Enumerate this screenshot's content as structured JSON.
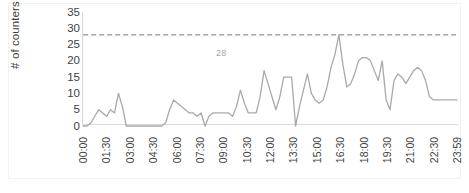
{
  "chart_data": {
    "type": "line",
    "title": "",
    "xlabel": "",
    "ylabel": "# of counters",
    "ylim": [
      0,
      35
    ],
    "yticks": [
      0,
      5,
      10,
      15,
      20,
      25,
      30,
      35
    ],
    "grid": false,
    "legend": "none",
    "line_color": "#a9a9a9",
    "threshold": {
      "value": 28,
      "label": "28",
      "style": "dashed",
      "color": "#a6a6a6"
    },
    "xtick_labels": [
      "00:00",
      "01:30",
      "03:00",
      "04:30",
      "06:00",
      "07:30",
      "09:00",
      "10:30",
      "12:00",
      "13:30",
      "15:00",
      "16:30",
      "18:00",
      "19:30",
      "21:00",
      "22:30",
      "23:59"
    ],
    "x": [
      "00:00",
      "00:15",
      "00:30",
      "00:45",
      "01:00",
      "01:15",
      "01:30",
      "01:45",
      "02:00",
      "02:15",
      "02:30",
      "02:45",
      "03:00",
      "03:15",
      "03:30",
      "03:45",
      "04:00",
      "04:15",
      "04:30",
      "04:45",
      "05:00",
      "05:15",
      "05:30",
      "05:45",
      "06:00",
      "06:15",
      "06:30",
      "06:45",
      "07:00",
      "07:15",
      "07:30",
      "07:45",
      "08:00",
      "08:15",
      "08:30",
      "08:45",
      "09:00",
      "09:15",
      "09:30",
      "09:45",
      "10:00",
      "10:15",
      "10:30",
      "10:45",
      "11:00",
      "11:15",
      "11:30",
      "11:45",
      "12:00",
      "12:15",
      "12:30",
      "12:45",
      "13:00",
      "13:15",
      "13:30",
      "13:45",
      "14:00",
      "14:15",
      "14:30",
      "14:45",
      "15:00",
      "15:15",
      "15:30",
      "15:45",
      "16:00",
      "16:15",
      "16:30",
      "16:45",
      "17:00",
      "17:15",
      "17:30",
      "17:45",
      "18:00",
      "18:15",
      "18:30",
      "18:45",
      "19:00",
      "19:15",
      "19:30",
      "19:45",
      "20:00",
      "20:15",
      "20:30",
      "20:45",
      "21:00",
      "21:15",
      "21:30",
      "21:45",
      "22:00",
      "22:15",
      "22:30",
      "22:45",
      "23:00",
      "23:15",
      "23:30",
      "23:59"
    ],
    "values": [
      0,
      0,
      1,
      3,
      5,
      4,
      3,
      5,
      4,
      10,
      6,
      0,
      0,
      0,
      0,
      0,
      0,
      0,
      0,
      0,
      0,
      1,
      5,
      8,
      7,
      6,
      5,
      4,
      4,
      3,
      4,
      0,
      3,
      4,
      4,
      4,
      4,
      4,
      3,
      6,
      11,
      7,
      4,
      4,
      4,
      9,
      17,
      13,
      9,
      5,
      9,
      15,
      15,
      15,
      0,
      6,
      11,
      16,
      10,
      8,
      7,
      8,
      12,
      18,
      22,
      28,
      19,
      12,
      13,
      16,
      20,
      21,
      21,
      20,
      17,
      14,
      20,
      8,
      5,
      14,
      16,
      15,
      13,
      15,
      17,
      18,
      17,
      14,
      9,
      8,
      8,
      8,
      8,
      8,
      8,
      8
    ]
  }
}
